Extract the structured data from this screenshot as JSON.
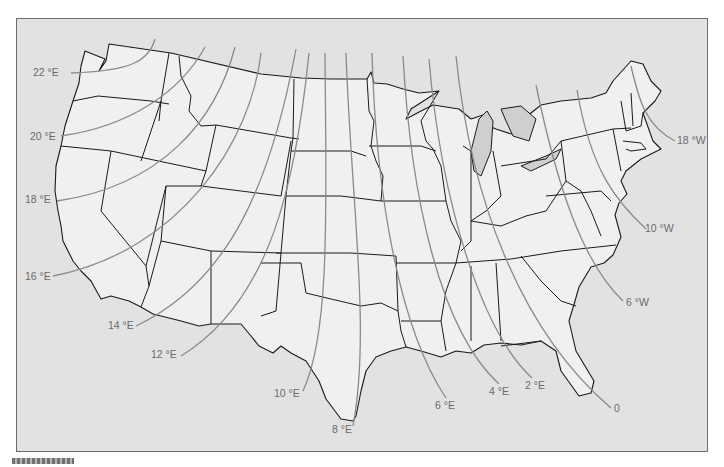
{
  "map": {
    "title": "Isogonic lines of magnetic declination — contiguous United States",
    "colors": {
      "ocean": "#e2e2e2",
      "land": "#f0f0f0",
      "state_border": "#1a1a1a",
      "isogonic_line": "#8a8a8a",
      "label": "#6a6a6a",
      "lake": "#cfcfcf"
    },
    "isogonic_lines": [
      {
        "id": "22E",
        "label": "22 °E",
        "label_x": 32,
        "label_y": 131
      },
      {
        "id": "20E",
        "label": "20 °E",
        "label_x": 29,
        "label_y": 137
      },
      {
        "id": "18E",
        "label": "18 °E",
        "label_x": 24,
        "label_y": 202
      },
      {
        "id": "16E",
        "label": "16 °E",
        "label_x": 24,
        "label_y": 277
      },
      {
        "id": "14E",
        "label": "14 °E",
        "label_x": 107,
        "label_y": 328
      },
      {
        "id": "12E",
        "label": "12 °E",
        "label_x": 150,
        "label_y": 355
      },
      {
        "id": "10E",
        "label": "10 °E",
        "label_x": 273,
        "label_y": 396
      },
      {
        "id": "8E",
        "label": "8 °E",
        "label_x": 331,
        "label_y": 432
      },
      {
        "id": "6E",
        "label": "6 °E",
        "label_x": 434,
        "label_y": 408
      },
      {
        "id": "4E",
        "label": "4 °E",
        "label_x": 488,
        "label_y": 394
      },
      {
        "id": "2E",
        "label": "2 °E",
        "label_x": 524,
        "label_y": 388
      },
      {
        "id": "0",
        "label": "0",
        "label_x": 613,
        "label_y": 411
      },
      {
        "id": "6W",
        "label": "6 °W",
        "label_x": 625,
        "label_y": 305
      },
      {
        "id": "10W",
        "label": "10 °W",
        "label_x": 644,
        "label_y": 231
      },
      {
        "id": "18W",
        "label": "18 °W",
        "label_x": 676,
        "label_y": 143
      }
    ]
  }
}
